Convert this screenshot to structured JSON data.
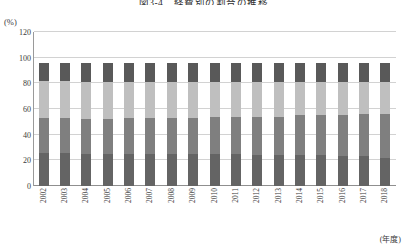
{
  "title": "図3-4　経費別の割合の推移",
  "y_unit": "(%)",
  "x_axis_label": "(年度)",
  "colors": {
    "segment_1": "#595959",
    "segment_2": "#7f7f7f",
    "segment_3": "#bfbfbf",
    "segment_4": "#646464",
    "gridline": "#d2d2d2",
    "axis": "#8f8f8f",
    "text": "#3a3a3a",
    "background": "#ffffff"
  },
  "chart_data": {
    "type": "bar",
    "title": "図3-4　経費別の割合の推移",
    "xlabel": "(年度)",
    "ylabel": "(%)",
    "ylim": [
      0,
      120
    ],
    "yticks": [
      0,
      20,
      40,
      60,
      80,
      100,
      120
    ],
    "grid": true,
    "stacked": true,
    "legend": "none",
    "categories": [
      "2002",
      "2003",
      "2004",
      "2005",
      "2006",
      "2007",
      "2008",
      "2009",
      "2010",
      "2011",
      "2012",
      "2013",
      "2014",
      "2015",
      "2016",
      "2017",
      "2018"
    ],
    "series": [
      {
        "name": "segment-1-bottom",
        "color": "#646464",
        "values": [
          26,
          26,
          25,
          25,
          25,
          25,
          25,
          25,
          25,
          25,
          24,
          24,
          24,
          24,
          23,
          23,
          22
        ]
      },
      {
        "name": "segment-2",
        "color": "#7f7f7f",
        "values": [
          27,
          27,
          27,
          27,
          28,
          28,
          28,
          28,
          29,
          29,
          30,
          30,
          31,
          31,
          32,
          33,
          34
        ]
      },
      {
        "name": "segment-3",
        "color": "#bfbfbf",
        "values": [
          29,
          29,
          29,
          29,
          28,
          28,
          28,
          28,
          27,
          27,
          27,
          27,
          26,
          26,
          26,
          25,
          25
        ]
      },
      {
        "name": "segment-4-top",
        "color": "#595959",
        "values": [
          14,
          14,
          15,
          15,
          15,
          15,
          15,
          15,
          15,
          15,
          15,
          15,
          15,
          15,
          15,
          15,
          15
        ]
      }
    ],
    "totals": [
      96,
      96,
      96,
      96,
      96,
      96,
      96,
      96,
      96,
      96,
      96,
      96,
      96,
      96,
      96,
      96,
      96
    ]
  }
}
